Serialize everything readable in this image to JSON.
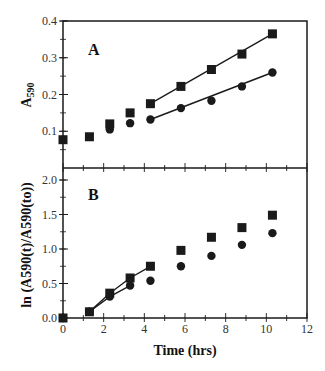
{
  "header": {
    "cropped_title": "                                    "
  },
  "chart_data": [
    {
      "panel": "A",
      "type": "scatter",
      "title": "",
      "panel_label": "A",
      "xlabel": "Time (hrs)",
      "ylabel": "A590",
      "ylabel_main": "A",
      "ylabel_sub": "590",
      "xlim": [
        0,
        12
      ],
      "ylim": [
        0,
        0.4
      ],
      "yticks": [
        0.1,
        0.2,
        0.3,
        0.4
      ],
      "ytick_labels": [
        "0.1",
        "0.2",
        "0.3",
        "0.4"
      ],
      "grid": false,
      "series": [
        {
          "name": "squares",
          "marker": "square",
          "x": [
            0,
            1.3,
            2.3,
            3.3,
            4.3,
            5.8,
            7.3,
            8.8,
            10.3
          ],
          "y": [
            0.077,
            0.085,
            0.12,
            0.15,
            0.175,
            0.222,
            0.268,
            0.31,
            0.365
          ],
          "fit_line": {
            "x": [
              4.3,
              10.3
            ],
            "y": [
              0.175,
              0.365
            ]
          }
        },
        {
          "name": "circles",
          "marker": "circle",
          "x": [
            2.3,
            3.3,
            4.3,
            5.8,
            7.3,
            8.8,
            10.3
          ],
          "y": [
            0.105,
            0.122,
            0.132,
            0.163,
            0.183,
            0.222,
            0.26
          ],
          "fit_line": {
            "x": [
              4.3,
              10.3
            ],
            "y": [
              0.132,
              0.26
            ]
          }
        }
      ]
    },
    {
      "panel": "B",
      "type": "scatter",
      "title": "",
      "panel_label": "B",
      "xlabel": "Time (hrs)",
      "ylabel": "ln (A590(t)/A590(to))",
      "xlim": [
        0,
        12
      ],
      "ylim": [
        0,
        2.17
      ],
      "xticks": [
        0,
        2,
        4,
        6,
        8,
        10,
        12
      ],
      "xtick_labels": [
        "0",
        "2",
        "4",
        "6",
        "8",
        "10",
        "12"
      ],
      "yticks": [
        0.0,
        0.5,
        1.0,
        1.5,
        2.0
      ],
      "ytick_labels": [
        "0.0",
        "0.5",
        "1.0",
        "1.5",
        "2.0"
      ],
      "grid": false,
      "series": [
        {
          "name": "squares",
          "marker": "square",
          "x": [
            0,
            1.3,
            2.3,
            3.3,
            4.3,
            5.8,
            7.3,
            8.8,
            10.3
          ],
          "y": [
            0,
            0.09,
            0.36,
            0.58,
            0.75,
            0.98,
            1.17,
            1.31,
            1.49
          ],
          "fit_line": {
            "x": [
              1.3,
              2.3,
              3.3,
              4.3
            ],
            "y": [
              0.09,
              0.36,
              0.58,
              0.75
            ]
          }
        },
        {
          "name": "circles",
          "marker": "circle",
          "x": [
            0,
            1.3,
            2.3,
            3.3,
            4.3,
            5.8,
            7.3,
            8.8,
            10.3
          ],
          "y": [
            0,
            0.09,
            0.31,
            0.47,
            0.54,
            0.75,
            0.9,
            1.06,
            1.23
          ],
          "fit_line": {
            "x": [
              1.3,
              2.3,
              3.3
            ],
            "y": [
              0.09,
              0.31,
              0.47
            ]
          }
        }
      ]
    }
  ],
  "labels": {
    "panel_a": "A",
    "panel_b": "B",
    "x_axis_title": "Time (hrs)",
    "y_axis_a_main": "A",
    "y_axis_a_sub": "590",
    "y_axis_b": "ln (A590(t)/A590(to))"
  },
  "colors": {
    "ink": "#1a1a1a",
    "background": "#ffffff"
  }
}
